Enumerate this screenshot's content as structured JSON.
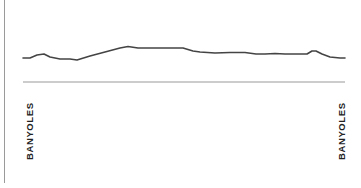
{
  "chart_data": {
    "type": "line",
    "title": "",
    "xlabel": "",
    "ylabel": "",
    "grid": false,
    "legend": null,
    "start_label": "BANYOLES",
    "end_label": "BANYOLES",
    "x": [
      23,
      30,
      37,
      44,
      50,
      60,
      70,
      77,
      90,
      105,
      120,
      128,
      138,
      150,
      165,
      183,
      193,
      200,
      215,
      230,
      245,
      256,
      265,
      275,
      285,
      300,
      307,
      312,
      316,
      322,
      330,
      340,
      345
    ],
    "values": [
      58,
      58,
      55,
      54,
      57,
      59,
      59,
      60,
      56,
      52,
      48,
      46.5,
      48,
      48,
      48,
      48,
      51,
      52,
      53,
      52.5,
      52.5,
      54,
      54,
      53.5,
      54,
      54,
      54,
      51,
      51,
      54,
      57,
      58,
      58
    ],
    "baseline_y": 82,
    "colors": {
      "profile_line": "#444444",
      "baseline": "#999999",
      "axis": "#9a9a9a"
    }
  }
}
